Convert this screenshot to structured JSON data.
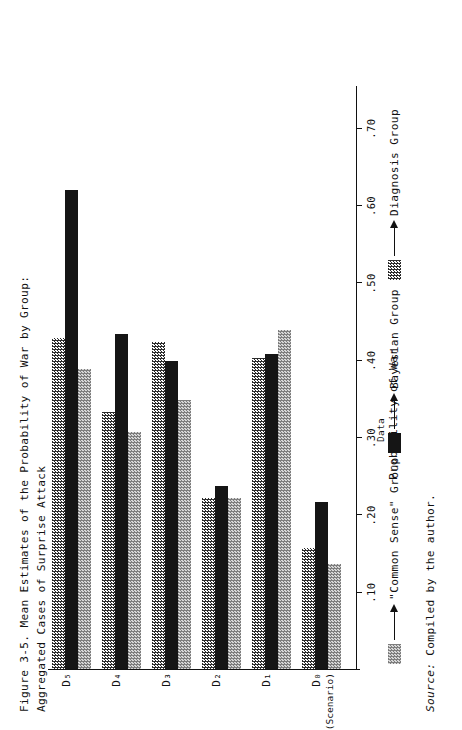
{
  "figure": {
    "caption": "Figure 3-5.  Mean Estimates of the Probability of War by Group:\nAggregated Cases of Surprise Attack",
    "source_label": "Source:",
    "source_text": " Compiled by the author."
  },
  "axes": {
    "value_axis_title": "Probability of War",
    "tick_labels": [
      ".10",
      ".20",
      ".30",
      ".40",
      ".50",
      ".60",
      ".70"
    ],
    "tick_values": [
      0.1,
      0.2,
      0.3,
      0.4,
      0.5,
      0.6,
      0.7
    ],
    "category_labels": [
      "D₀",
      "D₁",
      "D₂",
      "D₃",
      "D₄",
      "D₅"
    ],
    "category_sublabels": [
      "(Scenario)",
      "",
      "",
      "",
      "",
      ""
    ]
  },
  "legend": {
    "data_note": "Data",
    "items": [
      {
        "key": "common",
        "label": "\"Common Sense\" Group",
        "swatch": "light-checker-swatch"
      },
      {
        "key": "bayesian",
        "label": "Bayesian Group",
        "swatch": "solid-black-swatch"
      },
      {
        "key": "diagnosis",
        "label": "Diagnosis Group",
        "swatch": "dark-checker-swatch"
      }
    ]
  },
  "chart_data": {
    "type": "bar",
    "title": "Figure 3-5.  Mean Estimates of the Probability of War by Group: Aggregated Cases of Surprise Attack",
    "orientation": "horizontal",
    "xlabel": "",
    "ylabel": "Probability of War",
    "ylim": [
      0,
      0.75
    ],
    "grid": false,
    "legend_position": "bottom",
    "categories": [
      "D0 (Scenario)",
      "D1",
      "D2",
      "D3",
      "D4",
      "D5"
    ],
    "series": [
      {
        "name": "Diagnosis Group",
        "values": [
          0.155,
          0.4,
          0.22,
          0.42,
          0.33,
          0.425
        ]
      },
      {
        "name": "Bayesian Group",
        "values": [
          0.215,
          0.405,
          0.235,
          0.395,
          0.43,
          0.615
        ]
      },
      {
        "name": "\"Common Sense\" Group",
        "values": [
          0.135,
          0.435,
          0.22,
          0.345,
          0.305,
          0.385
        ]
      }
    ],
    "source": "Compiled by the author."
  }
}
